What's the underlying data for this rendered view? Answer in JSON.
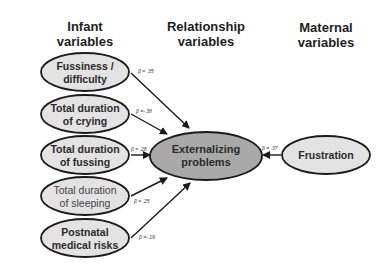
{
  "columns": {
    "infant": {
      "line1": "Infant",
      "line2": "variables"
    },
    "relationship": {
      "line1": "Relationship",
      "line2": "variables"
    },
    "maternal": {
      "line1": "Maternal",
      "line2": "variables"
    }
  },
  "infant_nodes": [
    {
      "line1": "Fussiness /",
      "line2": "difficulty",
      "beta": "β = .35"
    },
    {
      "line1": "Total duration",
      "line2": "of crying",
      "beta": "β =-.38"
    },
    {
      "line1": "Total duration",
      "line2": "of fussing",
      "beta": "β = .28"
    },
    {
      "line1": "Total duration",
      "line2": "of sleeping",
      "beta": "β = .25"
    },
    {
      "line1": "Postnatal",
      "line2": "medical risks",
      "beta": "β =-.19"
    }
  ],
  "outcome_node": {
    "line1": "Externalizing",
    "line2": "problems"
  },
  "maternal_nodes": [
    {
      "line1": "Frustration",
      "beta": "β = .37"
    }
  ],
  "colors": {
    "predictor_fill": "#e3e3e3",
    "outcome_fill": "#a9a9a9",
    "stroke": "#1a1a1a"
  }
}
